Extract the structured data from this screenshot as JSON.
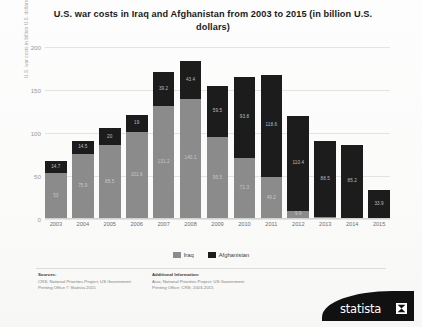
{
  "chart_data": {
    "type": "bar",
    "stacked": true,
    "title": "U.S. war costs in Iraq and Afghanistan from 2003 to 2015 (in billion U.S. dollars)",
    "xlabel": "",
    "ylabel": "U.S. war costs in billion U.S. dollars",
    "ylim": [
      0,
      200
    ],
    "yticks": [
      "0",
      "50",
      "100",
      "150",
      "200"
    ],
    "grid": true,
    "legend_position": "bottom",
    "categories": [
      "2003",
      "2004",
      "2005",
      "2006",
      "2007",
      "2008",
      "2009",
      "2010",
      "2011",
      "2012",
      "2013",
      "2014",
      "2015"
    ],
    "series": [
      {
        "name": "Iraq",
        "color": "#8b8b8b",
        "values": [
          53,
          75.9,
          85.5,
          101.6,
          131.2,
          140.1,
          95.5,
          71.3,
          49.2,
          9.9,
          2.2,
          1.2,
          0
        ],
        "labels": [
          "53",
          "75.9",
          "85.5",
          "101.6",
          "131.2",
          "140.1",
          "95.5",
          "71.3",
          "49.2",
          "9.9",
          "",
          "",
          ""
        ]
      },
      {
        "name": "Afghanistan",
        "color": "#1c1c1c",
        "values": [
          14.7,
          14.5,
          20,
          19,
          39.2,
          43.4,
          59.5,
          93.8,
          118.6,
          110.4,
          88.5,
          85.2,
          33.9
        ],
        "labels": [
          "14.7",
          "14.5",
          "20",
          "19",
          "39.2",
          "43.4",
          "59.5",
          "93.8",
          "118.6",
          "110.4",
          "88.5",
          "85.2",
          "33.9"
        ]
      }
    ],
    "totals": [
      67.7,
      90.4,
      105.5,
      120.6,
      170.4,
      183.5,
      155,
      165.1,
      167.8,
      120.3,
      90.7,
      86.4,
      33.9
    ]
  },
  "legend": {
    "items": [
      {
        "label": "Iraq",
        "swatch": "iraq-swatch"
      },
      {
        "label": "Afghanistan",
        "swatch": "afghanistan-swatch"
      }
    ]
  },
  "footer": {
    "sources_heading": "Sources:",
    "sources_text": "CRS; National Priorities Project; US Government Printing Office\n© Statista 2015",
    "additional_heading": "Additional Information:",
    "additional_text": "Asia; National Priorities Project; US Government Printing Office; CRS; 2003-2015",
    "logo_text": "statista"
  }
}
